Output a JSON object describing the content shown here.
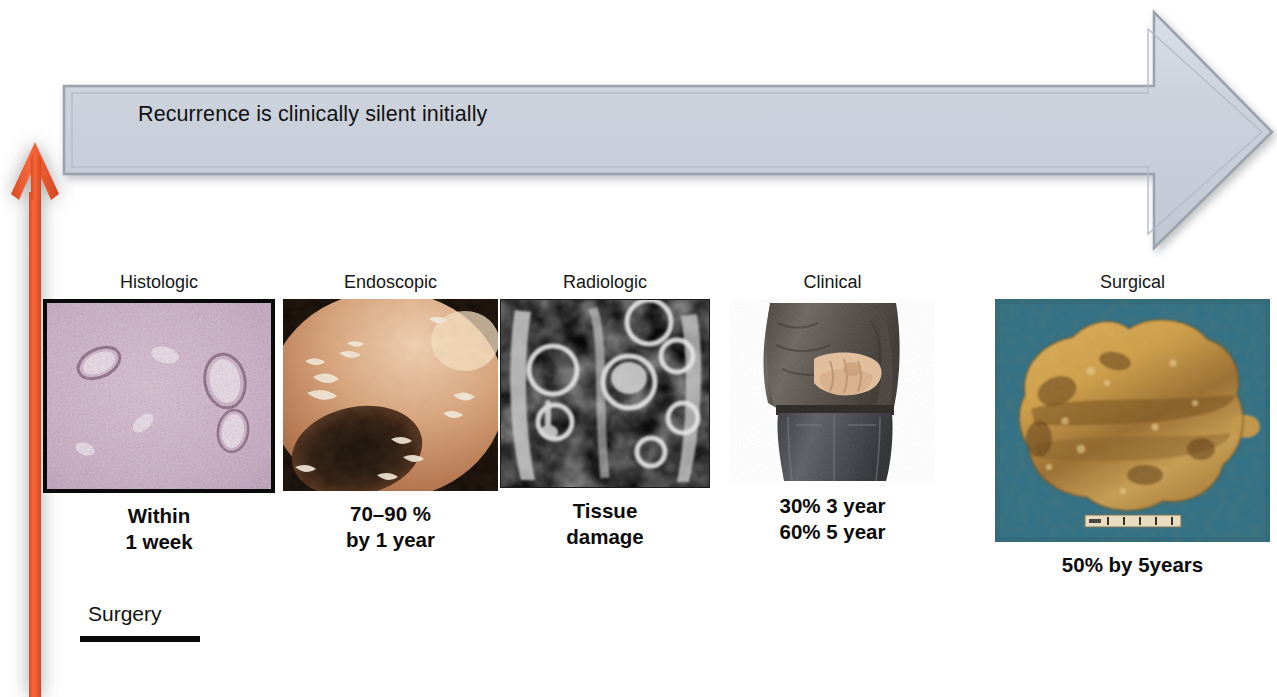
{
  "banner": {
    "text": "Recurrence is clinically silent initially",
    "fill": "#ccd2dc",
    "stroke": "#9aa2ae"
  },
  "timeline_arrow": {
    "name": "upward-time-arrow",
    "color": "#ef5b34",
    "direction": "up"
  },
  "baseline": {
    "label": "Surgery"
  },
  "columns": [
    {
      "id": "histologic",
      "label": "Histologic",
      "image": "histology-micrograph",
      "caption_lines": [
        "Within",
        "1 week"
      ]
    },
    {
      "id": "endoscopic",
      "label": "Endoscopic",
      "image": "endoscopy-photo",
      "caption_lines": [
        "70–90 %",
        "by 1 year"
      ]
    },
    {
      "id": "radiologic",
      "label": "Radiologic",
      "image": "mri-scan",
      "caption_lines": [
        "Tissue",
        "damage"
      ]
    },
    {
      "id": "clinical",
      "label": "Clinical",
      "image": "patient-abdominal-pain-photo",
      "caption_lines": [
        "30% 3 year",
        "60% 5 year"
      ]
    },
    {
      "id": "surgical",
      "label": "Surgical",
      "image": "resected-bowel-specimen-photo",
      "caption_lines": [
        "50% by 5years"
      ]
    }
  ]
}
